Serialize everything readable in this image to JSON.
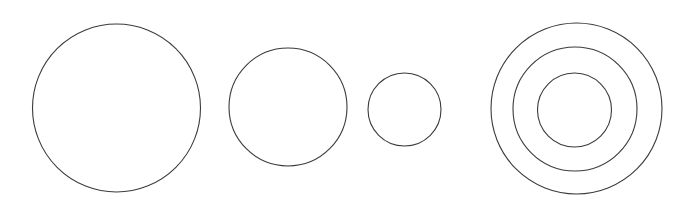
{
  "canvas": {
    "width": 674,
    "height": 216,
    "background_color": "#ffffff",
    "title": ""
  },
  "style": {
    "stroke_color": "#3b3b3b",
    "stroke_width": 1.1,
    "fill": "none"
  },
  "diagram": {
    "type": "circle-outlines",
    "group_count": 4,
    "shape_count": 6,
    "groups": [
      {
        "name": "large-circle",
        "shapes": [
          {
            "name": "circle-large",
            "cx": 116.5,
            "cy": 108,
            "r": 84,
            "diameter": 168
          }
        ]
      },
      {
        "name": "medium-circle",
        "shapes": [
          {
            "name": "circle-medium",
            "cx": 288,
            "cy": 107,
            "r": 59,
            "diameter": 118
          }
        ]
      },
      {
        "name": "small-circle",
        "shapes": [
          {
            "name": "circle-small",
            "cx": 404.5,
            "cy": 109.5,
            "r": 36.5,
            "diameter": 73
          }
        ]
      },
      {
        "name": "concentric-circles",
        "shapes": [
          {
            "name": "circle-concentric-outer",
            "cx": 576.5,
            "cy": 108.5,
            "r": 85.5,
            "diameter": 171
          },
          {
            "name": "circle-concentric-middle",
            "cx": 575,
            "cy": 109,
            "r": 62,
            "diameter": 124
          },
          {
            "name": "circle-concentric-inner",
            "cx": 574.5,
            "cy": 110,
            "r": 37,
            "diameter": 74
          }
        ]
      }
    ]
  }
}
